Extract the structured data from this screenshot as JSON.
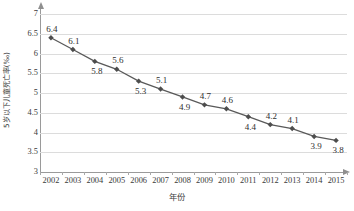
{
  "chart_data": {
    "type": "line",
    "title": "",
    "subtitle": "",
    "xlabel": "年份",
    "ylabel": "5岁以下儿童死亡率(‰)",
    "x": [
      2002,
      2003,
      2004,
      2005,
      2006,
      2007,
      2008,
      2009,
      2010,
      2011,
      2012,
      2013,
      2014,
      2015
    ],
    "categories": [
      "2002",
      "2003",
      "2004",
      "2005",
      "2006",
      "2007",
      "2008",
      "2009",
      "2010",
      "2011",
      "2012",
      "2013",
      "2014",
      "2015"
    ],
    "values": [
      6.4,
      6.1,
      5.8,
      5.6,
      5.3,
      5.1,
      4.9,
      4.7,
      4.6,
      4.4,
      4.2,
      4.1,
      3.9,
      3.8
    ],
    "data_labels": [
      "6.4",
      "6.1",
      "5.8",
      "5.6",
      "5.3",
      "5.1",
      "4.9",
      "4.7",
      "4.6",
      "4.4",
      "4.2",
      "4.1",
      "3.9",
      "3.8"
    ],
    "label_positions": [
      "above",
      "above",
      "below",
      "above",
      "below",
      "above",
      "below",
      "above",
      "above",
      "below",
      "above",
      "above",
      "below",
      "below"
    ],
    "ylim": [
      3,
      7
    ],
    "yticks": [
      7,
      6.5,
      6,
      5.5,
      5,
      4.5,
      4,
      3.5,
      3
    ],
    "ytick_labels": [
      "7",
      "6.5",
      "6",
      "5.5",
      "5",
      "4.5",
      "4",
      "3.5",
      "3"
    ],
    "grid": true,
    "grid_axis": "y",
    "legend": false,
    "legend_position": "none",
    "series": [
      {
        "name": "5岁以下儿童死亡率",
        "values": [
          6.4,
          6.1,
          5.8,
          5.6,
          5.3,
          5.1,
          4.9,
          4.7,
          4.6,
          4.4,
          4.2,
          4.1,
          3.9,
          3.8
        ],
        "marker": "diamond",
        "line_color": "#595959",
        "marker_color": "#4d4d4d"
      }
    ],
    "colors": {
      "line": "#595959",
      "marker": "#4d4d4d",
      "grid": "#dcdcdc",
      "axis": "#9a9a9a",
      "text": "#3a3a3a",
      "background": "#ffffff"
    }
  }
}
